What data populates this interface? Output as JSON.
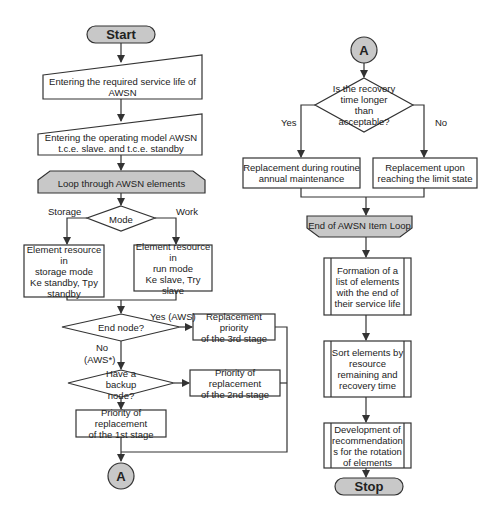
{
  "diagram": {
    "type": "flowchart",
    "left_column": {
      "start": "Start",
      "input_service_life": "Entering the required service life of AWSN",
      "input_operating_model": "Entering the operating model AWSN t.c.e. slave. and t.c.e. standby",
      "loop_start": "Loop through AWSN elements",
      "mode_decision": "Mode",
      "mode_branch_storage": "Storage",
      "mode_branch_work": "Work",
      "storage_resource": [
        "Element resource in",
        "storage mode",
        "Ke standby, Tpy",
        "standby"
      ],
      "run_resource": [
        "Element resource in",
        "run mode",
        "Ke slave, Try slave"
      ],
      "end_node_decision": "End node?",
      "end_node_yes": "Yes (AWS)",
      "end_node_no": [
        "No",
        "(AWS*)"
      ],
      "stage3": [
        "Replacement priority",
        "of the 3rd stage"
      ],
      "backup_decision": [
        "Have a backup",
        "node?"
      ],
      "stage2": [
        "Priority of replacement",
        "of the 2nd stage"
      ],
      "stage1": [
        "Priority of replacement",
        "of the 1st stage"
      ],
      "connector_out": "A"
    },
    "right_column": {
      "connector_in": "A",
      "recovery_decision": [
        "Is the recovery",
        "time longer than",
        "acceptable?"
      ],
      "recovery_yes": "Yes",
      "recovery_no": "No",
      "routine_replacement": [
        "Replacement during routine",
        "annual maintenance"
      ],
      "limit_replacement": [
        "Replacement upon",
        "reaching the limit state"
      ],
      "loop_end": "End of AWSN Item Loop",
      "formation_list": [
        "Formation of a",
        "list of elements",
        "with the end of",
        "their service life"
      ],
      "sort_elements": [
        "Sort elements by",
        "resource",
        "remaining and",
        "recovery time"
      ],
      "recommendations": [
        "Development of",
        "recommendation",
        "s for the rotation",
        "of elements"
      ],
      "stop": "Stop"
    },
    "colors": {
      "stroke": "#333333",
      "fill_gray": "#c8c8c8",
      "fill_white": "#ffffff",
      "text": "#222222"
    }
  }
}
